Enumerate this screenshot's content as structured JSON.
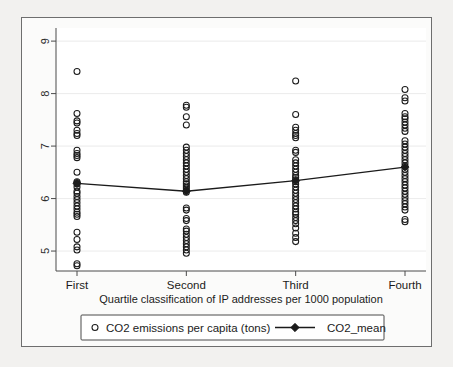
{
  "chart_data": {
    "type": "scatter",
    "title": "",
    "xlabel": "Quartile classification of IP addresses per 1000 population",
    "ylabel": "",
    "categories": [
      "First",
      "Second",
      "Third",
      "Fourth"
    ],
    "xtick_labels": [
      "First",
      "Second",
      "Third",
      "Fourth"
    ],
    "ytick_labels": [
      "5",
      "6",
      "7",
      "8",
      "9"
    ],
    "ytick_values": [
      5,
      6,
      7,
      8,
      9
    ],
    "ylim": [
      4.62,
      9.25
    ],
    "grid": false,
    "legend_position": "below-axis",
    "legend": [
      {
        "label": "CO2 emissions per capita (tons)",
        "marker": "open-circle"
      },
      {
        "label": "CO2_mean",
        "marker": "line-with-solid-diamond"
      }
    ],
    "series": [
      {
        "name": "CO2 emissions per capita (tons)",
        "type": "scatter",
        "marker": "open-circle",
        "color": "#1b1b1b",
        "points_by_category": {
          "First": [
            8.42,
            7.62,
            7.48,
            7.44,
            7.3,
            7.24,
            7.2,
            6.92,
            6.86,
            6.82,
            6.78,
            6.5,
            6.32,
            6.3,
            6.28,
            6.22,
            6.14,
            6.1,
            6.04,
            5.98,
            5.92,
            5.86,
            5.8,
            5.74,
            5.7,
            5.66,
            5.36,
            5.22,
            5.08,
            5.02,
            4.76,
            4.72
          ],
          "Second": [
            7.78,
            7.74,
            7.56,
            7.4,
            6.98,
            6.92,
            6.86,
            6.8,
            6.74,
            6.68,
            6.62,
            6.56,
            6.5,
            6.44,
            6.38,
            6.32,
            6.28,
            6.24,
            6.2,
            6.16,
            6.12,
            5.82,
            5.78,
            5.62,
            5.58,
            5.42,
            5.38,
            5.32,
            5.26,
            5.2,
            5.14,
            5.08,
            5.02,
            4.96
          ],
          "Third": [
            8.24,
            7.6,
            7.36,
            7.3,
            7.24,
            7.2,
            7.16,
            6.92,
            6.88,
            6.74,
            6.68,
            6.62,
            6.56,
            6.5,
            6.44,
            6.4,
            6.36,
            6.32,
            6.28,
            6.22,
            6.16,
            6.1,
            6.04,
            5.98,
            5.92,
            5.86,
            5.8,
            5.74,
            5.7,
            5.64,
            5.58,
            5.52,
            5.44,
            5.34,
            5.26,
            5.18
          ],
          "Fourth": [
            8.08,
            7.92,
            7.86,
            7.62,
            7.56,
            7.52,
            7.46,
            7.4,
            7.34,
            7.28,
            7.1,
            7.04,
            6.98,
            6.92,
            6.86,
            6.8,
            6.74,
            6.68,
            6.62,
            6.56,
            6.5,
            6.44,
            6.38,
            6.32,
            6.26,
            6.2,
            6.14,
            6.08,
            6.02,
            5.96,
            5.9,
            5.84,
            5.78,
            5.6,
            5.56
          ]
        }
      },
      {
        "name": "CO2_mean",
        "type": "line",
        "marker": "solid-diamond",
        "color": "#1b1b1b",
        "categories": [
          "First",
          "Second",
          "Third",
          "Fourth"
        ],
        "values": [
          6.29,
          6.14,
          6.34,
          6.6
        ]
      }
    ]
  },
  "figure": {
    "background_color": "#fbfbfa",
    "page_background_color": "#f2f1ef",
    "border_color": "#6e6e6e",
    "axis_color": "#4a4a4a",
    "marker_color": "#1b1b1b"
  }
}
